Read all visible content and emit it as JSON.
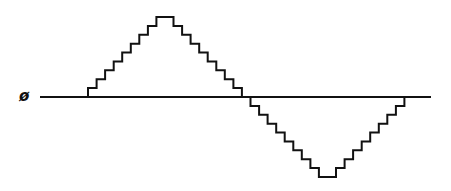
{
  "diagram": {
    "title": "",
    "axis_label": "ø",
    "levels": [
      0,
      1,
      2,
      3,
      4,
      5,
      6,
      7,
      8,
      9,
      9,
      8,
      7,
      6,
      5,
      4,
      3,
      2,
      1,
      0,
      -1,
      -2,
      -3,
      -4,
      -5,
      -6,
      -7,
      -8,
      -9,
      -9,
      -8,
      -7,
      -6,
      -5,
      -4,
      -3,
      -2,
      -1,
      0
    ],
    "max_level": 9,
    "line_color": "#111111"
  }
}
